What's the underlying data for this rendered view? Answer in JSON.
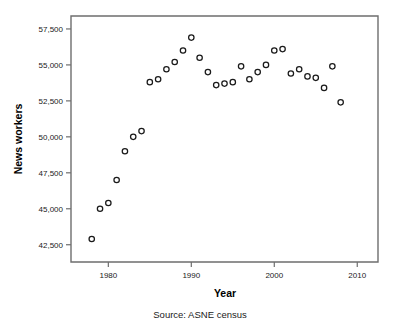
{
  "chart_data": {
    "type": "scatter",
    "title": "",
    "xlabel": "Year",
    "ylabel": "News workers",
    "caption": "Source: ASNE census",
    "xlim": [
      1975.5,
      2012.5
    ],
    "ylim": [
      41300,
      58400
    ],
    "grid": false,
    "legend": null,
    "xticks": [
      1980,
      1990,
      2000,
      2010
    ],
    "xtick_labels": [
      "1980",
      "1990",
      "2000",
      "2010"
    ],
    "yticks": [
      42500,
      45000,
      47500,
      50000,
      52500,
      55000,
      57500
    ],
    "ytick_labels": [
      "42,500",
      "45,000",
      "47,500",
      "50,000",
      "52,500",
      "55,000",
      "57,500"
    ],
    "marker": "open-circle",
    "marker_color": "#1a1a1a",
    "x": [
      1978,
      1979,
      1980,
      1981,
      1982,
      1983,
      1984,
      1985,
      1986,
      1987,
      1988,
      1989,
      1990,
      1991,
      1992,
      1993,
      1994,
      1995,
      1996,
      1997,
      1998,
      1999,
      2000,
      2001,
      2002,
      2003,
      2004,
      2005,
      2006,
      2007,
      2008
    ],
    "values": [
      42900,
      45000,
      45400,
      47000,
      49000,
      50000,
      50400,
      53800,
      54000,
      54700,
      55200,
      56000,
      56900,
      55500,
      54500,
      53600,
      53700,
      53800,
      54900,
      54000,
      54500,
      55000,
      56000,
      56100,
      54400,
      54700,
      54200,
      54100,
      53400,
      54900,
      52400
    ]
  },
  "figure": {
    "axis_color": "#6e6e6e",
    "background": "#ffffff"
  }
}
